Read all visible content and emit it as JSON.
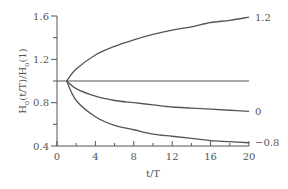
{
  "chart_data": {
    "type": "line",
    "title": "",
    "xlabel": "t/T",
    "ylabel": "H_o(t/T)/H_o(1)",
    "ylabel_parts": {
      "main1": "H",
      "sub1": "o",
      "mid": "(t/T)/H",
      "sub2": "o",
      "end": "(1)"
    },
    "xlim": [
      0,
      20
    ],
    "ylim": [
      0.4,
      1.6
    ],
    "x_ticks": [
      "0",
      "4",
      "8",
      "12",
      "16",
      "20"
    ],
    "y_ticks": [
      "0.4",
      "0.8",
      "1.2",
      "1.6"
    ],
    "grid": false,
    "legend": "none (curves labeled at right end)",
    "reference_line": {
      "y": 1.0,
      "x_range": [
        0,
        20
      ]
    },
    "series": [
      {
        "name": "1.2",
        "x": [
          1,
          2,
          4,
          6,
          8,
          10,
          12,
          14,
          16,
          18,
          20
        ],
        "values": [
          1.0,
          1.11,
          1.24,
          1.32,
          1.38,
          1.43,
          1.47,
          1.5,
          1.54,
          1.56,
          1.59
        ]
      },
      {
        "name": "0",
        "x": [
          1,
          2,
          4,
          6,
          8,
          10,
          12,
          14,
          16,
          18,
          20
        ],
        "values": [
          1.0,
          0.93,
          0.86,
          0.82,
          0.8,
          0.78,
          0.76,
          0.75,
          0.74,
          0.73,
          0.72
        ]
      },
      {
        "name": "-0.8",
        "x": [
          1,
          2,
          4,
          6,
          8,
          10,
          12,
          14,
          16,
          18,
          20
        ],
        "values": [
          1.0,
          0.82,
          0.67,
          0.59,
          0.55,
          0.51,
          0.49,
          0.47,
          0.45,
          0.44,
          0.43
        ]
      }
    ]
  }
}
